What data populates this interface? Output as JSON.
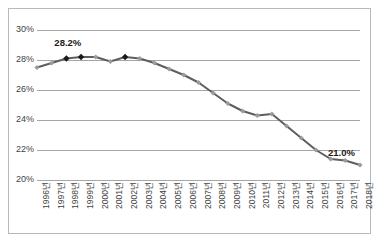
{
  "chart_data": {
    "type": "line",
    "title": "",
    "subtitle": "",
    "xlabel": "",
    "ylabel": "",
    "categories": [
      "1996년",
      "1997년",
      "1998년",
      "1999년",
      "2000년",
      "2001년",
      "2002년",
      "2003년",
      "2004년",
      "2005년",
      "2006년",
      "2007년",
      "2008년",
      "2009년",
      "2010년",
      "2011년",
      "2012년",
      "2013년",
      "2014년",
      "2015년",
      "2016년",
      "2017년",
      "2018년"
    ],
    "values": [
      27.5,
      27.8,
      28.1,
      28.2,
      28.2,
      27.9,
      28.2,
      28.1,
      27.8,
      27.4,
      27.0,
      26.5,
      25.8,
      25.1,
      24.6,
      24.3,
      24.4,
      23.6,
      22.8,
      22.0,
      21.4,
      21.3,
      21.0
    ],
    "series": [
      {
        "name": "",
        "values": [
          27.5,
          27.8,
          28.1,
          28.2,
          28.2,
          27.9,
          28.2,
          28.1,
          27.8,
          27.4,
          27.0,
          26.5,
          25.8,
          25.1,
          24.6,
          24.3,
          24.4,
          23.6,
          22.8,
          22.0,
          21.4,
          21.3,
          21.0
        ]
      }
    ],
    "ylim": [
      20,
      30
    ],
    "ytick_labels": [
      "30%",
      "28%",
      "26%",
      "24%",
      "22%",
      "20%"
    ],
    "ytick_values": [
      30,
      28,
      26,
      24,
      22,
      20
    ],
    "grid": true,
    "legend": "none",
    "line_color": "#5e5e5e",
    "marker_color": "#9b9b9b",
    "highlight_marker_color": "#1a1a1a",
    "gridline_color": "#a6a6a6",
    "border_color": "#b9b9b9",
    "annotations": [
      {
        "text": "28.2%",
        "x_category": "1998년",
        "value": 28.2
      },
      {
        "text": "21.0%",
        "x_category": "2018년",
        "value": 21.0
      }
    ],
    "highlighted_points": [
      "1998년",
      "1999년",
      "2002년"
    ]
  }
}
